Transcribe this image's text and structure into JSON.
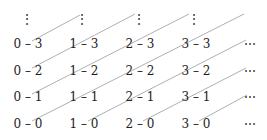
{
  "diagram": {
    "type": "cantor-pairing-grid",
    "columns": [
      0,
      1,
      2,
      3
    ],
    "rows": [
      3,
      2,
      1,
      0
    ],
    "separator": "–",
    "vertical_ellipsis": "⋮",
    "horizontal_ellipsis": "⋯",
    "labels": [
      {
        "text": "0 – 3",
        "col": 0,
        "row": 3
      },
      {
        "text": "1 – 3",
        "col": 1,
        "row": 3
      },
      {
        "text": "2 – 3",
        "col": 2,
        "row": 3
      },
      {
        "text": "3 – 3",
        "col": 3,
        "row": 3
      },
      {
        "text": "0 – 2",
        "col": 0,
        "row": 2
      },
      {
        "text": "1 – 2",
        "col": 1,
        "row": 2
      },
      {
        "text": "2 – 2",
        "col": 2,
        "row": 2
      },
      {
        "text": "3 – 2",
        "col": 3,
        "row": 2
      },
      {
        "text": "0 – 1",
        "col": 0,
        "row": 1
      },
      {
        "text": "1 – 1",
        "col": 1,
        "row": 1
      },
      {
        "text": "2 – 1",
        "col": 2,
        "row": 1
      },
      {
        "text": "3 – 1",
        "col": 3,
        "row": 1
      },
      {
        "text": "0 – 0",
        "col": 0,
        "row": 0
      },
      {
        "text": "1 – 0",
        "col": 1,
        "row": 0
      },
      {
        "text": "2 – 0",
        "col": 2,
        "row": 0
      },
      {
        "text": "3 – 0",
        "col": 3,
        "row": 0
      }
    ],
    "line_color": "#9a9a9a",
    "text_color": "#222222"
  }
}
